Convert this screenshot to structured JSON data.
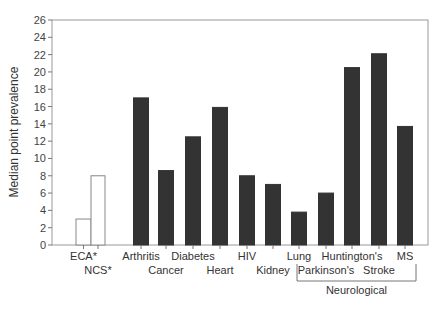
{
  "chart_data": {
    "type": "bar",
    "title": "",
    "xlabel": "",
    "ylabel": "Median point prevalence",
    "ylim": [
      0,
      26
    ],
    "yticks": [
      0,
      2,
      4,
      6,
      8,
      10,
      12,
      14,
      16,
      18,
      20,
      22,
      24,
      26
    ],
    "grid": false,
    "categories": [
      "ECA*",
      "NCS*",
      "Arthritis",
      "Cancer",
      "Diabetes",
      "Heart",
      "HIV",
      "Kidney",
      "Lung",
      "Parkinson's",
      "Huntington's",
      "Stroke",
      "MS"
    ],
    "values": [
      3.0,
      8.0,
      17.0,
      8.6,
      12.5,
      15.9,
      8.0,
      7.0,
      3.8,
      6.0,
      20.5,
      22.1,
      13.7
    ],
    "bar_styles": [
      "open",
      "open",
      "filled",
      "filled",
      "filled",
      "filled",
      "filled",
      "filled",
      "filled",
      "filled",
      "filled",
      "filled",
      "filled"
    ],
    "label_rows": [
      0,
      1,
      0,
      1,
      0,
      1,
      0,
      1,
      0,
      1,
      0,
      1,
      0
    ],
    "group_annotation": {
      "label": "Neurological",
      "from": "Parkinson's",
      "to": "MS"
    },
    "colors": {
      "filled": "#333333",
      "open": "#ffffff",
      "outline": "#888888"
    }
  }
}
